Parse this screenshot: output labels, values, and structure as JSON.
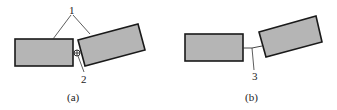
{
  "figure": {
    "panels": [
      {
        "id": "a",
        "caption": "(a)",
        "labels": {
          "bodies": "1",
          "hinge": "2"
        }
      },
      {
        "id": "b",
        "caption": "(b)",
        "labels": {
          "link": "3"
        }
      }
    ],
    "colors": {
      "fill": "#b5b5b5",
      "stroke": "#1a1a1a",
      "line": "#333333"
    }
  }
}
